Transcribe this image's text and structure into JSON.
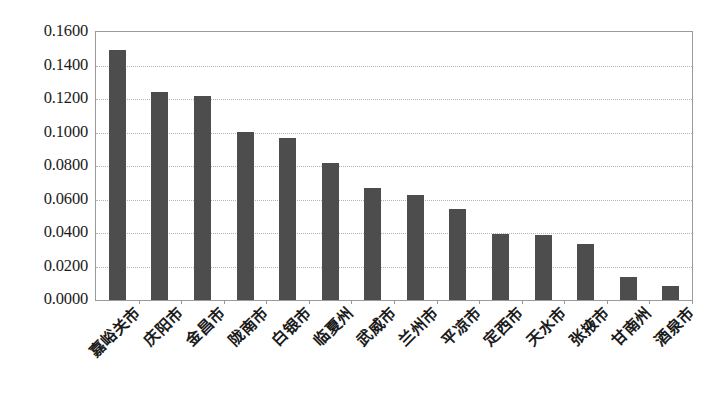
{
  "chart_data": {
    "type": "bar",
    "title": "",
    "subtitle": "",
    "xlabel": "",
    "ylabel": "",
    "categories": [
      "嘉峪关市",
      "庆阳市",
      "金昌市",
      "陇南市",
      "白银市",
      "临夏州",
      "武威市",
      "兰州市",
      "平凉市",
      "定西市",
      "天水市",
      "张掖市",
      "甘南州",
      "酒泉市"
    ],
    "values": [
      0.149,
      0.124,
      0.122,
      0.1005,
      0.097,
      0.082,
      0.067,
      0.0625,
      0.0545,
      0.0395,
      0.039,
      0.0335,
      0.0135,
      0.0082
    ],
    "ylim": [
      0.0,
      0.16
    ],
    "ytick_labels": [
      "0.1600",
      "0.1400",
      "0.1200",
      "0.1000",
      "0.0800",
      "0.0600",
      "0.0400",
      "0.0200",
      "0.0000"
    ],
    "ytick_values": [
      0.16,
      0.14,
      0.12,
      0.1,
      0.08,
      0.06,
      0.04,
      0.02,
      0.0
    ],
    "grid": true,
    "grid_axis": "y",
    "legend": null,
    "legend_position": "none",
    "series": [
      {
        "name": "",
        "values": [
          0.149,
          0.124,
          0.122,
          0.1005,
          0.097,
          0.082,
          0.067,
          0.0625,
          0.0545,
          0.0395,
          0.039,
          0.0335,
          0.0135,
          0.0082
        ]
      }
    ],
    "bar_color": "#4d4d4d",
    "grid_color": "#b4b4b4",
    "axis_color": "#9a9a9a",
    "background_color": "#ffffff"
  }
}
